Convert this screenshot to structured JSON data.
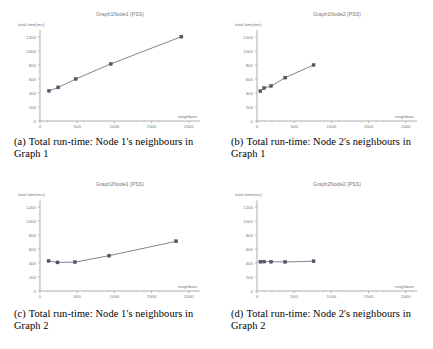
{
  "figure": {
    "panels": [
      {
        "key": "a",
        "caption_tag": "(a)",
        "caption_text": "Total run-time: Node 1's neighbours in Graph 1",
        "chart_data": {
          "type": "line",
          "title": "Graph1Node1 (PSS)",
          "xlabel": "neighbors",
          "ylabel": "total time(ms)",
          "xlim": [
            0,
            2150
          ],
          "ylim": [
            0,
            1300
          ],
          "xticks": [
            0,
            500,
            1000,
            1500,
            2000
          ],
          "yticks": [
            0,
            200,
            400,
            600,
            800,
            1000,
            1200
          ],
          "grid": false,
          "legend": "none",
          "series": [
            {
              "name": "PSS",
              "x": [
                120,
                245,
                480,
                950,
                1900
              ],
              "y": [
                430,
                480,
                600,
                815,
                1205
              ]
            }
          ]
        }
      },
      {
        "key": "b",
        "caption_tag": "(b)",
        "caption_text": "Total run-time: Node 2's neighbours in Graph 1",
        "chart_data": {
          "type": "line",
          "title": "Graph1Node2 (PSS)",
          "xlabel": "neighbors",
          "ylabel": "total time(ms)",
          "xlim": [
            0,
            2150
          ],
          "ylim": [
            0,
            1300
          ],
          "xticks": [
            0,
            500,
            1000,
            1500,
            2000
          ],
          "yticks": [
            0,
            200,
            400,
            600,
            800,
            1000,
            1200
          ],
          "grid": false,
          "legend": "none",
          "series": [
            {
              "name": "PSS",
              "x": [
                45,
                95,
                190,
                380,
                760
              ],
              "y": [
                425,
                470,
                500,
                620,
                800
              ]
            }
          ]
        }
      },
      {
        "key": "c",
        "caption_tag": "(c)",
        "caption_text": "Total run-time: Node 1's neighbours in Graph 2",
        "chart_data": {
          "type": "line",
          "title": "Graph2Node1 (PSS)",
          "xlabel": "neighbors",
          "ylabel": "total time(ms)",
          "xlim": [
            0,
            2150
          ],
          "ylim": [
            0,
            1300
          ],
          "xticks": [
            0,
            500,
            1000,
            1500,
            2000
          ],
          "yticks": [
            0,
            200,
            400,
            600,
            800,
            1000,
            1200
          ],
          "grid": false,
          "legend": "none",
          "series": [
            {
              "name": "PSS",
              "x": [
                115,
                235,
                470,
                930,
                1830
              ],
              "y": [
                430,
                408,
                412,
                505,
                710
              ]
            }
          ]
        }
      },
      {
        "key": "d",
        "caption_tag": "(d)",
        "caption_text": "Total run-time: Node 2's neighbours in Graph 2",
        "chart_data": {
          "type": "line",
          "title": "Graph2Node2 (PSS)",
          "xlabel": "neighbors",
          "ylabel": "total time(ms)",
          "xlim": [
            0,
            2150
          ],
          "ylim": [
            0,
            1300
          ],
          "xticks": [
            0,
            500,
            1000,
            1500,
            2000
          ],
          "yticks": [
            0,
            200,
            400,
            600,
            800,
            1000,
            1200
          ],
          "grid": false,
          "legend": "none",
          "series": [
            {
              "name": "PSS",
              "x": [
                45,
                95,
                190,
                380,
                760
              ],
              "y": [
                418,
                420,
                418,
                415,
                425
              ]
            }
          ]
        }
      }
    ]
  }
}
